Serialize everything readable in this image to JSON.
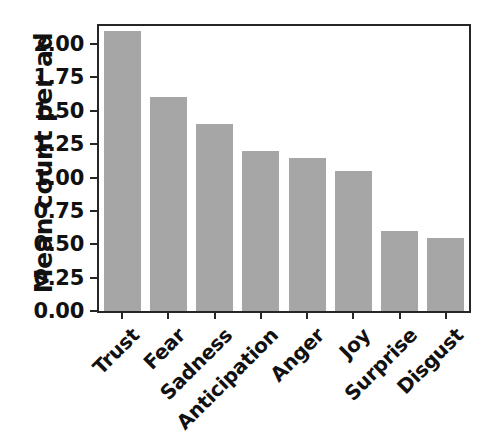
{
  "chart_data": {
    "type": "bar",
    "title": "",
    "xlabel": "",
    "ylabel": "Mean count per ad",
    "categories": [
      "Trust",
      "Fear",
      "Sadness",
      "Anticipation",
      "Anger",
      "Joy",
      "Surprise",
      "Disgust"
    ],
    "values": [
      2.1,
      1.6,
      1.4,
      1.2,
      1.15,
      1.05,
      0.6,
      0.55
    ],
    "ylim": [
      0.0,
      2.135
    ],
    "yticks": [
      0.0,
      0.25,
      0.5,
      0.75,
      1.0,
      1.25,
      1.5,
      1.75,
      2.0
    ],
    "ytick_labels": [
      "0.00",
      "0.25",
      "0.50",
      "0.75",
      "1.00",
      "1.25",
      "1.50",
      "1.75",
      "2.00"
    ],
    "grid": false,
    "legend": null,
    "bar_color": "#a6a6a6",
    "axis_color": "#262626",
    "background_color": "#ffffff",
    "xtick_label_rotation": -45
  }
}
